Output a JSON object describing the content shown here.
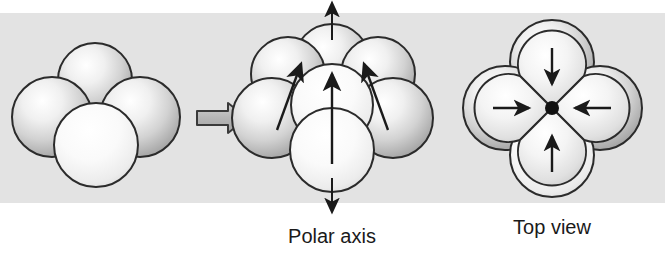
{
  "figure": {
    "background_color": "#ffffff",
    "band_color": "#e2e2e2",
    "band": {
      "top": 13,
      "bottom": 203
    },
    "sphere_outline_color": "#2b2b2b",
    "sphere_fill_light": "#ffffff",
    "sphere_fill_mid": "#d8d8d8",
    "sphere_fill_dark": "#9a9a9a",
    "arrow_color": "#1a1a1a",
    "block_arrow_fill": "#b9b9b9"
  },
  "panels": {
    "left": {
      "name": "unpolarized-cluster",
      "sphere_count": 4,
      "has_arrows": false,
      "spheres": [
        {
          "id": "back-top",
          "cx": 95,
          "cy": 80,
          "r": 37
        },
        {
          "id": "left",
          "cx": 52,
          "cy": 117,
          "r": 40
        },
        {
          "id": "right",
          "cx": 140,
          "cy": 117,
          "r": 40
        },
        {
          "id": "front",
          "cx": 96,
          "cy": 145,
          "r": 42
        }
      ]
    },
    "transition": {
      "name": "block-arrow",
      "direction": "right",
      "x": 197,
      "y": 118,
      "length": 50,
      "thickness": 14
    },
    "middle": {
      "name": "polarized-cluster-side-view",
      "sphere_count": 7,
      "label": "Polar axis",
      "axis": {
        "type": "double-headed-vertical",
        "x": 332,
        "top_y": 3,
        "bottom_y": 212
      },
      "spheres": [
        {
          "id": "back-top",
          "cx": 332,
          "cy": 62,
          "r": 38
        },
        {
          "id": "back-left",
          "cx": 288,
          "cy": 74,
          "r": 37
        },
        {
          "id": "back-right",
          "cx": 378,
          "cy": 74,
          "r": 37
        },
        {
          "id": "mid-left",
          "cx": 272,
          "cy": 118,
          "r": 40
        },
        {
          "id": "mid-right",
          "cx": 393,
          "cy": 118,
          "r": 40
        },
        {
          "id": "center",
          "cx": 332,
          "cy": 105,
          "r": 41
        },
        {
          "id": "front",
          "cx": 332,
          "cy": 150,
          "r": 42
        }
      ],
      "dipole_arrows": [
        {
          "id": "center-dipole",
          "x1": 332,
          "y1": 160,
          "x2": 332,
          "y2": 72,
          "tilt": 0
        },
        {
          "id": "left-dipole",
          "x1": 277,
          "y1": 128,
          "x2": 300,
          "y2": 62,
          "tilt": -20
        },
        {
          "id": "right-dipole",
          "x1": 388,
          "y1": 128,
          "x2": 366,
          "y2": 62,
          "tilt": 20
        }
      ]
    },
    "right": {
      "name": "polarized-cluster-top-view",
      "label": "Top view",
      "center_dot": {
        "cx": 552,
        "cy": 108,
        "r": 7
      },
      "outer_spheres": [
        {
          "id": "top",
          "cx": 552,
          "cy": 62,
          "r": 42
        },
        {
          "id": "left",
          "cx": 505,
          "cy": 108,
          "r": 42
        },
        {
          "id": "right",
          "cx": 600,
          "cy": 108,
          "r": 42
        },
        {
          "id": "bottom",
          "cx": 552,
          "cy": 155,
          "r": 42
        }
      ],
      "lobes": [
        {
          "id": "top-lobe",
          "direction": "down",
          "cx": 552,
          "cy": 70
        },
        {
          "id": "left-lobe",
          "direction": "right",
          "cx": 512,
          "cy": 108
        },
        {
          "id": "right-lobe",
          "direction": "left",
          "cx": 592,
          "cy": 108
        },
        {
          "id": "bottom-lobe",
          "direction": "up",
          "cx": 552,
          "cy": 146
        }
      ],
      "dipole_arrows": [
        {
          "id": "top-arrow",
          "x1": 552,
          "y1": 48,
          "x2": 552,
          "y2": 82,
          "points": "down"
        },
        {
          "id": "left-arrow",
          "x1": 495,
          "y1": 108,
          "x2": 528,
          "y2": 108,
          "points": "right"
        },
        {
          "id": "right-arrow",
          "x1": 609,
          "y1": 108,
          "x2": 576,
          "y2": 108,
          "points": "left"
        },
        {
          "id": "bottom-arrow",
          "x1": 552,
          "y1": 170,
          "x2": 552,
          "y2": 136,
          "points": "up"
        }
      ]
    }
  },
  "labels": {
    "polar_axis": "Polar axis",
    "top_view": "Top view"
  }
}
